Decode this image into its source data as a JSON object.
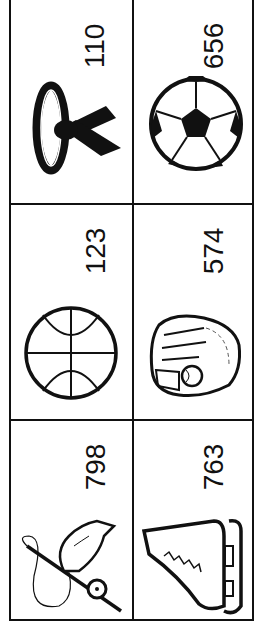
{
  "grid": {
    "line_color": "#111111",
    "rows": [
      {
        "cells": [
          {
            "icon": "karate-belt-icon",
            "number": "110"
          },
          {
            "icon": "soccer-ball-icon",
            "number": "656"
          }
        ]
      },
      {
        "cells": [
          {
            "icon": "basketball-icon",
            "number": "123"
          },
          {
            "icon": "baseball-glove-icon",
            "number": "574"
          }
        ]
      },
      {
        "cells": [
          {
            "icon": "fishing-rod-icon",
            "number": "798"
          },
          {
            "icon": "ice-skate-icon",
            "number": "763"
          }
        ]
      }
    ]
  }
}
